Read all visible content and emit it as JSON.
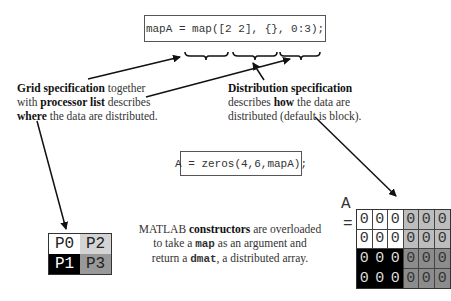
{
  "code": {
    "map_statement": "mapA = map([2 2], {}, 0:3);",
    "zeros_statement": "A = zeros(4,6,mapA);"
  },
  "annotations": {
    "grid": {
      "bold1": "Grid specification",
      "text1": " together",
      "text2": "with ",
      "bold2": "processor list",
      "text3": " describes",
      "bold3": "where",
      "text4": " the data are distributed."
    },
    "distribution": {
      "bold1": "Distribution specification",
      "text1": "describes ",
      "bold2": "how",
      "text2": " the data are",
      "text3": "distributed (default is block)."
    },
    "constructors": {
      "text1": "MATLAB ",
      "bold1": "constructors",
      "text2": " are overloaded",
      "text3": "to take a ",
      "mono1": "map",
      "text4": " as an argument and",
      "text5": "return a ",
      "mono2": "dmat",
      "text6": ", a distributed array."
    }
  },
  "processor_grid": {
    "cells": [
      {
        "label": "P0",
        "bg": "#ffffff",
        "fg": "#222222"
      },
      {
        "label": "P2",
        "bg": "#d4d4d4",
        "fg": "#222222"
      },
      {
        "label": "P1",
        "bg": "#000000",
        "fg": "#ffffff"
      },
      {
        "label": "P3",
        "bg": "#999999",
        "fg": "#222222"
      }
    ]
  },
  "array_A": {
    "name": "A",
    "equals": "=",
    "rows": [
      [
        "0",
        "0",
        "0",
        "0",
        "0",
        "0"
      ],
      [
        "0",
        "0",
        "0",
        "0",
        "0",
        "0"
      ],
      [
        "0",
        "0",
        "0",
        "0",
        "0",
        "0"
      ],
      [
        "0",
        "0",
        "0",
        "0",
        "0",
        "0"
      ]
    ],
    "colors": {
      "P0": "#ffffff",
      "P2": "#d4d4d4",
      "P1": "#000000",
      "P3": "#999999"
    }
  }
}
